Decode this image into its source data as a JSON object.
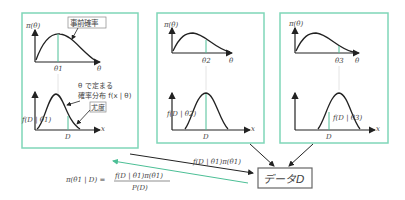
{
  "colors": {
    "frame": "#7fd6b8",
    "curve": "#222222",
    "accent_line": "#4cbf96",
    "text": "#444444",
    "box_border": "#666666"
  },
  "panels": [
    {
      "prior_axis_label": "π(θ)",
      "theta_tick": "θ1",
      "theta_axis": "θ",
      "callout_prior": "事前確率",
      "callout_dist_line1": "θ で定まる",
      "callout_dist_line2": "確率分布 f(x | θ)",
      "callout_likelihood": "尤度",
      "likelihood_label": "f(D | θ1)",
      "x_axis": "x",
      "data_tick": "D"
    },
    {
      "prior_axis_label": "π(θ)",
      "theta_tick": "θ2",
      "theta_axis": "θ",
      "likelihood_label": "f(D | θ2)",
      "x_axis": "x",
      "data_tick": "D"
    },
    {
      "prior_axis_label": "π(θ)",
      "theta_tick": "θ3",
      "theta_axis": "θ",
      "likelihood_label": "f(D | θ3)",
      "x_axis": "x",
      "data_tick": "D"
    }
  ],
  "arrow_label": "f(D | θ1)π(θ1)",
  "data_box": "データD",
  "formula": {
    "lhs": "π(θ1 | D) =",
    "numerator": "f(D | θ1)π(θ1)",
    "denominator": "P(D)"
  }
}
